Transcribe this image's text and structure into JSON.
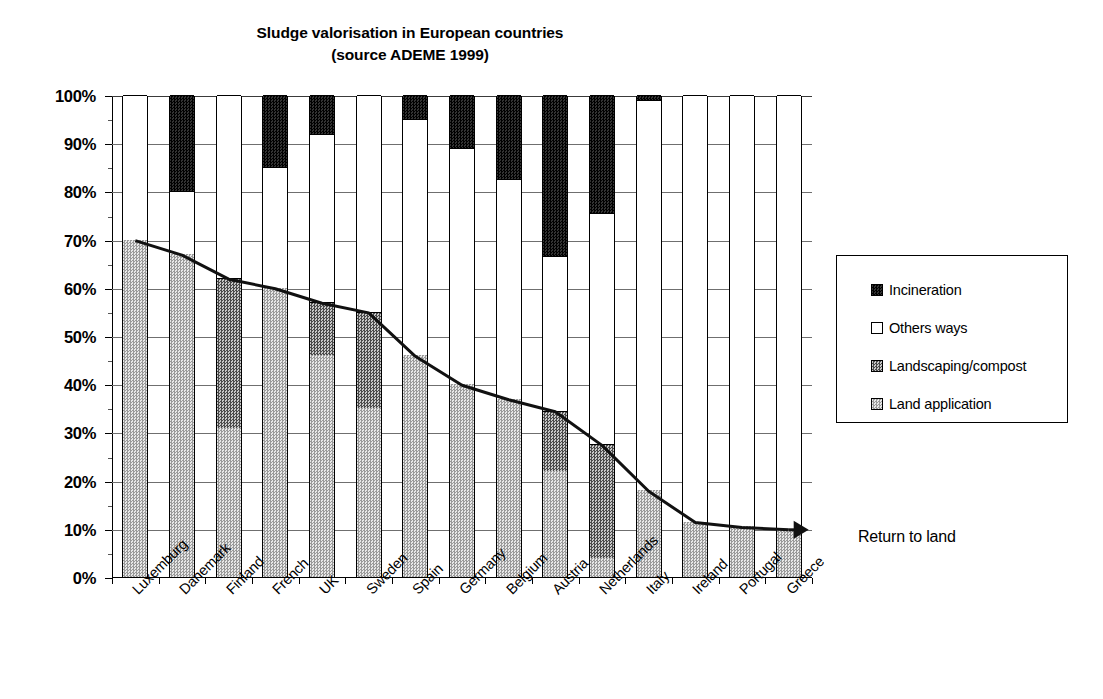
{
  "chart_data": {
    "type": "bar",
    "subtype": "stacked-100-percent-with-overlay-line",
    "title": "Sludge valorisation in European countries",
    "subtitle": "(source ADEME 1999)",
    "xlabel": "",
    "ylabel": "",
    "ylim": [
      0,
      100
    ],
    "ytick_labels": [
      "0%",
      "10%",
      "20%",
      "30%",
      "40%",
      "50%",
      "60%",
      "70%",
      "80%",
      "90%",
      "100%"
    ],
    "ytick_values": [
      0,
      10,
      20,
      30,
      40,
      50,
      60,
      70,
      80,
      90,
      100
    ],
    "grid": true,
    "legend_position": "right",
    "categories": [
      "Luxemburg",
      "Danemark",
      "Finland",
      "French",
      "UK",
      "Sweden",
      "Spain",
      "Germany",
      "Belgium",
      "Austria",
      "Netherlands",
      "Italy",
      "Ireland",
      "Portugal",
      "Greece"
    ],
    "series": [
      {
        "name": "Land application",
        "color": "#b5b5b5",
        "values": [
          70,
          67,
          31,
          60,
          46,
          35,
          46,
          40,
          37,
          22,
          4,
          18,
          11.5,
          10.5,
          10
        ]
      },
      {
        "name": "Landscaping/compost",
        "color": "#6b6b6b",
        "values": [
          0,
          0,
          31,
          0,
          11,
          20,
          0,
          0,
          0,
          12.5,
          23.5,
          0,
          0,
          0,
          0
        ]
      },
      {
        "name": "Others ways",
        "color": "#ffffff",
        "values": [
          30,
          13,
          38,
          25,
          35,
          45,
          49,
          49,
          45.5,
          32,
          48,
          81,
          88.5,
          89.5,
          90
        ]
      },
      {
        "name": "Incineration",
        "color": "#000000",
        "values": [
          0,
          20,
          0,
          15,
          8,
          0,
          5,
          11,
          17.5,
          33.5,
          24.5,
          1,
          0,
          0,
          0
        ]
      }
    ],
    "overlay_line": {
      "name": "Return to land",
      "values": [
        70,
        67,
        62,
        60,
        57,
        55,
        46,
        40,
        37,
        34.5,
        27.5,
        18,
        11.5,
        10.5,
        10
      ],
      "arrow_end": true
    },
    "annotations": [
      {
        "text": "Return to land"
      }
    ]
  },
  "legend": {
    "items": [
      {
        "label": "Incineration",
        "swatch": "incin"
      },
      {
        "label": "Others ways",
        "swatch": "others"
      },
      {
        "label": "Landscaping/compost",
        "swatch": "compost"
      },
      {
        "label": "Land application",
        "swatch": "land"
      }
    ]
  }
}
